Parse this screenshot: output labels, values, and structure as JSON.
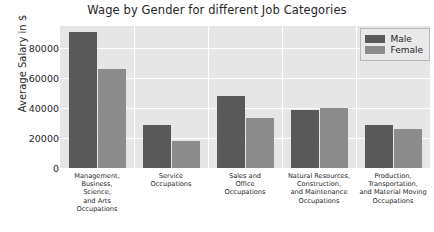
{
  "chart_data": {
    "type": "bar",
    "title": "Wage by Gender for different Job Categories",
    "xlabel": "",
    "ylabel": "Average Salary in $",
    "ylim": [
      0,
      95000
    ],
    "yticks": [
      0,
      20000,
      40000,
      60000,
      80000
    ],
    "ytick_labels": [
      "0",
      "20000",
      "40000",
      "60000",
      "80000"
    ],
    "grid": true,
    "legend_position": "upper right",
    "categories": [
      "Management, Business, Science, and Arts Occupations",
      "Service Occupations",
      "Sales and Office Occupations",
      "Natural Resources, Construction, and Maintenance Occupations",
      "Production, Transportation, and Material Moving Occupations"
    ],
    "category_lines": [
      [
        "Management,",
        "Business,",
        "Science,",
        "and Arts",
        "Occupations"
      ],
      [
        "Service",
        "Occupations"
      ],
      [
        "Sales and",
        "Office",
        "Occupations"
      ],
      [
        "Natural Resources,",
        "Construction,",
        "and Maintenance",
        "Occupations"
      ],
      [
        "Production,",
        "Transportation,",
        "and Material Moving",
        "Occupations"
      ]
    ],
    "series": [
      {
        "name": "Male",
        "color": "#595959",
        "values": [
          91000,
          29000,
          48000,
          39000,
          28500
        ]
      },
      {
        "name": "Female",
        "color": "#8c8c8c",
        "values": [
          66000,
          18000,
          33500,
          40000,
          26000
        ]
      }
    ]
  },
  "legend": {
    "items": [
      {
        "label": "Male",
        "color": "#595959"
      },
      {
        "label": "Female",
        "color": "#8c8c8c"
      }
    ]
  },
  "style": {
    "plot_background": "#e6e6e6",
    "grid_color": "#ffffff",
    "text_color": "#262626"
  }
}
